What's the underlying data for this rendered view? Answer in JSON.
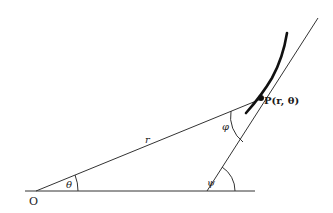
{
  "diagram": {
    "labels": {
      "origin": "O",
      "point": "P(r, θ)",
      "radius": "r",
      "theta": "θ",
      "phi": "φ",
      "psi": "ψ"
    },
    "colors": {
      "line": "#333333",
      "curve": "#111111",
      "background": "#ffffff"
    }
  }
}
